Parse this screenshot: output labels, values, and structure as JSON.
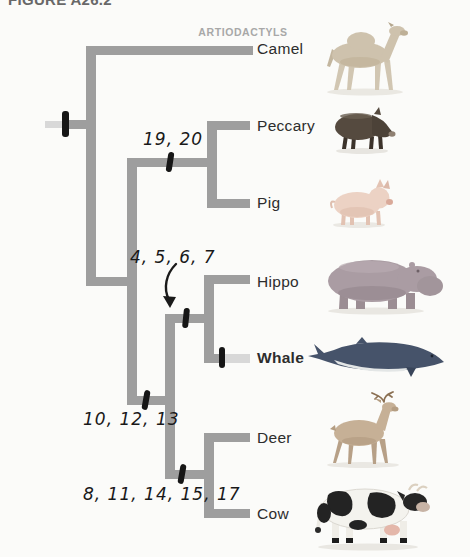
{
  "figure": {
    "title": "FIGURE A26.2",
    "group_label": "ARTIODACTYLS"
  },
  "taxa": [
    {
      "name": "Camel"
    },
    {
      "name": "Peccary"
    },
    {
      "name": "Pig"
    },
    {
      "name": "Hippo"
    },
    {
      "name": "Whale"
    },
    {
      "name": "Deer"
    },
    {
      "name": "Cow"
    }
  ],
  "character_marks": [
    {
      "label": "19, 20"
    },
    {
      "label": "4, 5, 6, 7"
    },
    {
      "label": "10, 12, 13"
    },
    {
      "label": "8, 11, 14, 15, 17"
    }
  ],
  "topology": "(Camel,((Peccary,Pig),((Hippo,Whale),(Deer,Cow))))",
  "emphasis": {
    "bold_taxon": "Whale"
  },
  "colors": {
    "branch": "#9e9e9e",
    "branch_faded": "#d8d8d8",
    "tick": "#161616",
    "group_label": "#a8a8a8",
    "title": "#686868",
    "taxon_text": "#2d2d2d",
    "handwriting": "#191919",
    "background": "#fbfbf9"
  }
}
